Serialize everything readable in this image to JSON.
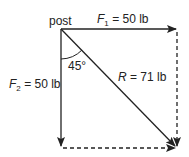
{
  "diagram": {
    "type": "vector-addition",
    "origin_label": "post",
    "vectors": [
      {
        "id": "F1",
        "symbol": "F",
        "subscript": "1",
        "equals": " = ",
        "value": "50 lb",
        "direction": "right"
      },
      {
        "id": "F2",
        "symbol": "F",
        "subscript": "2",
        "equals": " = ",
        "value": "50 lb",
        "direction": "down"
      },
      {
        "id": "R",
        "symbol": "R",
        "equals": " = ",
        "value": "71 lb",
        "direction": "diagonal down-right"
      }
    ],
    "angle_label": "45°",
    "colors": {
      "line": "#222222",
      "background": "#ffffff"
    }
  }
}
